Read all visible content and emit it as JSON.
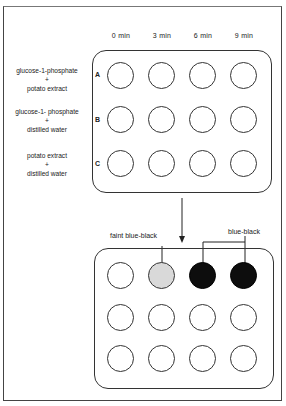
{
  "columns": [
    "0 min",
    "3 min",
    "6 min",
    "9 min"
  ],
  "rows": [
    {
      "letter": "A",
      "line1": "glucose-1-phosphate",
      "plus": "+",
      "line2": "potato extract"
    },
    {
      "letter": "B",
      "line1": "glucose-1- phosphate",
      "plus": "+",
      "line2": "distilled water"
    },
    {
      "letter": "C",
      "line1": "potato extract",
      "plus": "+",
      "line2": "distilled water"
    }
  ],
  "result_plate": {
    "wells": [
      [
        "clear",
        "faint",
        "dark",
        "dark"
      ],
      [
        "clear",
        "clear",
        "clear",
        "clear"
      ],
      [
        "clear",
        "clear",
        "clear",
        "clear"
      ]
    ]
  },
  "annotations": {
    "faint": "faint blue-black",
    "dark": "blue-black"
  },
  "colors": {
    "dark_well": "#0d0d0d",
    "faint_well": "#d9d9d9",
    "outline": "#333333"
  }
}
